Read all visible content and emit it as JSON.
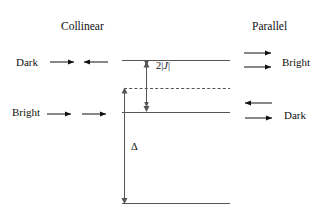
{
  "figure": {
    "background_color": "#ffffff",
    "line_color": "#555555",
    "arrow_color": "#111111",
    "text_color": "#111111"
  },
  "headings": {
    "left": "Collinear",
    "right": "Parallel"
  },
  "left_column": {
    "upper_state_label": "Dark",
    "lower_state_label": "Bright",
    "upper_dipoles": "right-arrow, left-arrow (antiparallel)",
    "lower_dipoles": "right-arrow, right-arrow (parallel)"
  },
  "right_column": {
    "upper_state_label": "Bright",
    "lower_state_label": "Dark",
    "upper_dipoles": "right-arrow, right-arrow (parallel)",
    "lower_dipoles": "left-arrow, right-arrow (antiparallel)"
  },
  "energy_labels": {
    "splitting": "2|J|",
    "splitting_prefix": "2|",
    "splitting_symbol": "J",
    "splitting_suffix": "|",
    "gap": "Δ"
  },
  "levels": {
    "upper_level": "excited state upper (dark, collinear)",
    "lower_level": "excited state lower (bright, collinear)",
    "dashed_level": "unperturbed monomer level",
    "ground_level": "ground state"
  }
}
